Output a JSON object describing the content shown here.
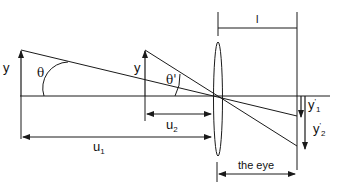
{
  "diagram": {
    "type": "optical ray diagram (angular magnification)",
    "colors": {
      "stroke": "#1a1a1a",
      "background": "#ffffff"
    },
    "labels": {
      "object1_height": "y",
      "object2_height": "y",
      "angle1": "θ",
      "angle2": "θ'",
      "lens_to_eye_distance": "l",
      "image1_height_base": "y",
      "image1_height_prime": "'",
      "image1_height_sub": "1",
      "image2_height_base": "y",
      "image2_height_prime": "'",
      "image2_height_sub": "2",
      "distance1_base": "u",
      "distance1_sub": "1",
      "distance2_base": "u",
      "distance2_sub": "2",
      "eye_span": "the eye"
    },
    "elements": {
      "optical_axis": "horizontal",
      "lens": "thin convex lens (ellipse)",
      "retina": "vertical line at right",
      "objects": [
        "upright arrow at far position u1",
        "upright arrow at near position u2"
      ],
      "images": [
        "inverted arrow y'1",
        "inverted arrow y'2"
      ]
    }
  }
}
